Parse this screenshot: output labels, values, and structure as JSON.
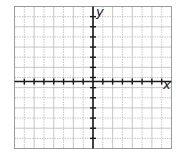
{
  "chart_data": {
    "type": "scatter",
    "title": "",
    "xlabel": "x",
    "ylabel": "y",
    "xlim": [
      -7,
      7
    ],
    "ylim": [
      -6,
      6
    ],
    "grid": true,
    "series": [],
    "x_ticks_count": 14,
    "y_ticks_count": 12,
    "legend": null
  },
  "labels": {
    "x_axis": "x",
    "y_axis": "y"
  },
  "colors": {
    "grid_line": "#b8b8b8",
    "grid_border": "#9a9a9a",
    "axis": "#1a1a1a",
    "background": "#ffffff"
  }
}
